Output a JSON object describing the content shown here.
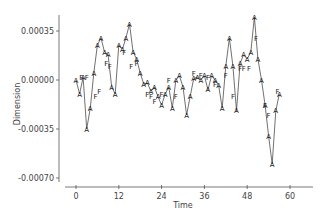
{
  "chart_data": {
    "type": "line",
    "title": "",
    "xlabel": "Time",
    "ylabel": "Dimension",
    "xlim": [
      -3,
      66
    ],
    "ylim": [
      -0.0008,
      0.0005
    ],
    "xticks": [
      0,
      12,
      24,
      36,
      48,
      60
    ],
    "xtick_labels": [
      "0",
      "12",
      "24",
      "36",
      "48",
      "60"
    ],
    "yticks": [
      0.00035,
      0.0,
      -0.00035,
      -0.0007
    ],
    "ytick_labels": [
      "0.00035",
      "0.00000",
      "-0.00035",
      "-0.00070"
    ],
    "grid": false,
    "legend": [],
    "series": [
      {
        "name": "A",
        "marker": "A",
        "x": [
          0,
          1,
          2,
          3,
          4,
          5,
          6,
          7,
          8,
          9,
          10,
          11,
          12,
          13,
          14,
          15,
          16,
          17,
          18,
          19,
          20,
          21,
          22,
          23,
          24,
          25,
          26,
          27,
          28,
          29,
          30,
          31,
          32,
          33,
          34,
          35,
          36,
          37,
          38,
          39,
          40,
          41,
          42,
          43,
          44,
          45,
          46,
          47,
          48,
          49,
          50,
          51,
          52,
          53,
          54,
          55,
          56,
          57
        ],
        "y": [
          0.0,
          -0.0001,
          2e-05,
          -0.00035,
          -0.0002,
          5e-05,
          0.00025,
          0.0003,
          0.0002,
          0.00018,
          -5e-05,
          -0.0001,
          0.00025,
          0.00022,
          0.0003,
          0.0004,
          0.0002,
          0.00015,
          5e-05,
          -3e-05,
          -2e-05,
          -8e-05,
          -5e-05,
          -0.00012,
          -0.00018,
          -0.0001,
          -5e-05,
          -0.0002,
          0.0,
          3e-05,
          -5e-05,
          -0.00025,
          -0.00012,
          1e-05,
          2e-05,
          0.0,
          3e-05,
          -7e-05,
          3e-05,
          0.0,
          -4e-05,
          -0.0002,
          0.0001,
          0.0003,
          0.0001,
          -0.00022,
          0.00012,
          0.00018,
          0.00015,
          0.0002,
          0.00045,
          0.00015,
          0.0,
          -0.00018,
          -0.0004,
          -0.0006,
          -0.00022,
          -0.0001
        ]
      }
    ],
    "markers_F": [
      {
        "x": 1.5,
        "y": 2e-05
      },
      {
        "x": 3,
        "y": 2e-05
      },
      {
        "x": 5.5,
        "y": -0.00012
      },
      {
        "x": 6.5,
        "y": -8e-05
      },
      {
        "x": 8.5,
        "y": 0.00012
      },
      {
        "x": 9.5,
        "y": 0.0001
      },
      {
        "x": 13.5,
        "y": 0.0002
      },
      {
        "x": 15.5,
        "y": 0.0001
      },
      {
        "x": 17,
        "y": 0.00012
      },
      {
        "x": 20,
        "y": -0.0001
      },
      {
        "x": 21,
        "y": -0.00012
      },
      {
        "x": 22,
        "y": -0.00015
      },
      {
        "x": 24,
        "y": -0.0001
      },
      {
        "x": 26,
        "y": 0.0
      },
      {
        "x": 28,
        "y": -0.00012
      },
      {
        "x": 33,
        "y": 5e-05
      },
      {
        "x": 35,
        "y": 3e-05
      },
      {
        "x": 37,
        "y": 2e-05
      },
      {
        "x": 39,
        "y": -3e-05
      },
      {
        "x": 42,
        "y": 3e-05
      },
      {
        "x": 44,
        "y": -0.00012
      },
      {
        "x": 46,
        "y": 8e-05
      },
      {
        "x": 47,
        "y": 8e-05
      },
      {
        "x": 48.5,
        "y": 8e-05
      },
      {
        "x": 50.5,
        "y": 0.0003
      },
      {
        "x": 53,
        "y": -0.00018
      },
      {
        "x": 54,
        "y": -0.00025
      },
      {
        "x": 56.5,
        "y": -8e-05
      }
    ]
  },
  "layout": {
    "plot_left": 59,
    "x0_px": 76,
    "x_px_per_unit": 3.567,
    "y0_px": 80,
    "y_px_per_unit": 140000,
    "x_axis_y": 187,
    "y_axis_top": 15,
    "y_axis_bottom": 182,
    "x_axis_left": 65,
    "x_axis_right": 313
  }
}
